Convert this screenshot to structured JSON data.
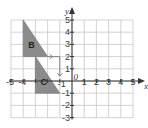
{
  "diagram": {
    "type": "coordinate-grid",
    "x_axis": {
      "label": "x",
      "min": -5,
      "max": 5,
      "ticks": [
        "-5",
        "-4",
        "1",
        "2",
        "3",
        "4",
        "5"
      ]
    },
    "y_axis": {
      "label": "y",
      "min": -3,
      "max": 5,
      "ticks": [
        "5",
        "4",
        "3",
        "2",
        "1",
        "-1",
        "-2",
        "-3"
      ]
    },
    "origin_label": "0",
    "hidden_x_ticks_note": "-3, -2, -1 labels obscured by shape C (-1 shown near origin)",
    "extra_x_tick": "-1",
    "shapes": [
      {
        "name": "B",
        "vertices": [
          [
            -4,
            5
          ],
          [
            -4,
            2
          ],
          [
            -2,
            2
          ]
        ],
        "fill": "#8c8c8c"
      },
      {
        "name": "C",
        "vertices": [
          [
            -3,
            2
          ],
          [
            -3,
            -1
          ],
          [
            -1,
            -1
          ]
        ],
        "fill": "#8c8c8c"
      }
    ],
    "translation_arrow": {
      "from": [
        -2,
        2
      ],
      "corner": [
        -1,
        2
      ],
      "to": [
        -1,
        0.4
      ],
      "color": "#7a7a7a"
    },
    "colors": {
      "grid": "#c8c8c8",
      "axis": "#333333",
      "shape": "#8c8c8c"
    }
  }
}
